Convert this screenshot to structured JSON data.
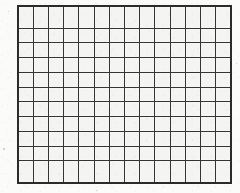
{
  "image": {
    "kind": "scanned-paper-grid",
    "width": 240,
    "height": 193,
    "page_background": "#fbfbfa",
    "description": "Hand-drawn / printed blank rectangular grid on off-white scanned paper"
  },
  "grid": {
    "name": "blank-grid",
    "columns": 14,
    "rows": 11,
    "total_cells": 154,
    "cell_width_px": 15.4,
    "cell_height_px": 16.3,
    "origin_x_px": 17,
    "origin_y_px": 5,
    "grid_width_px": 215,
    "grid_height_px": 179,
    "line_color": "#343434",
    "outer_border_color": "#2b2b2b",
    "cell_fill_color": "#f4f4f2",
    "inner_line_width_px": 1.6,
    "outer_line_width_px": 2.2,
    "cell_contents": []
  },
  "margins": {
    "left_px": 17,
    "top_px": 5,
    "right_px": 8,
    "bottom_px": 9,
    "color": "#fbfbfa"
  },
  "artifacts": [
    {
      "name": "margin-speck-left",
      "x": 3,
      "y": 148,
      "size": 2.2
    },
    {
      "name": "margin-speck-top-left",
      "x": 8,
      "y": 11,
      "size": 1.2
    },
    {
      "name": "margin-speck-bottom",
      "x": 96,
      "y": 190,
      "size": 1.1
    },
    {
      "name": "margin-speck-right",
      "x": 236,
      "y": 63,
      "size": 1.3
    }
  ]
}
